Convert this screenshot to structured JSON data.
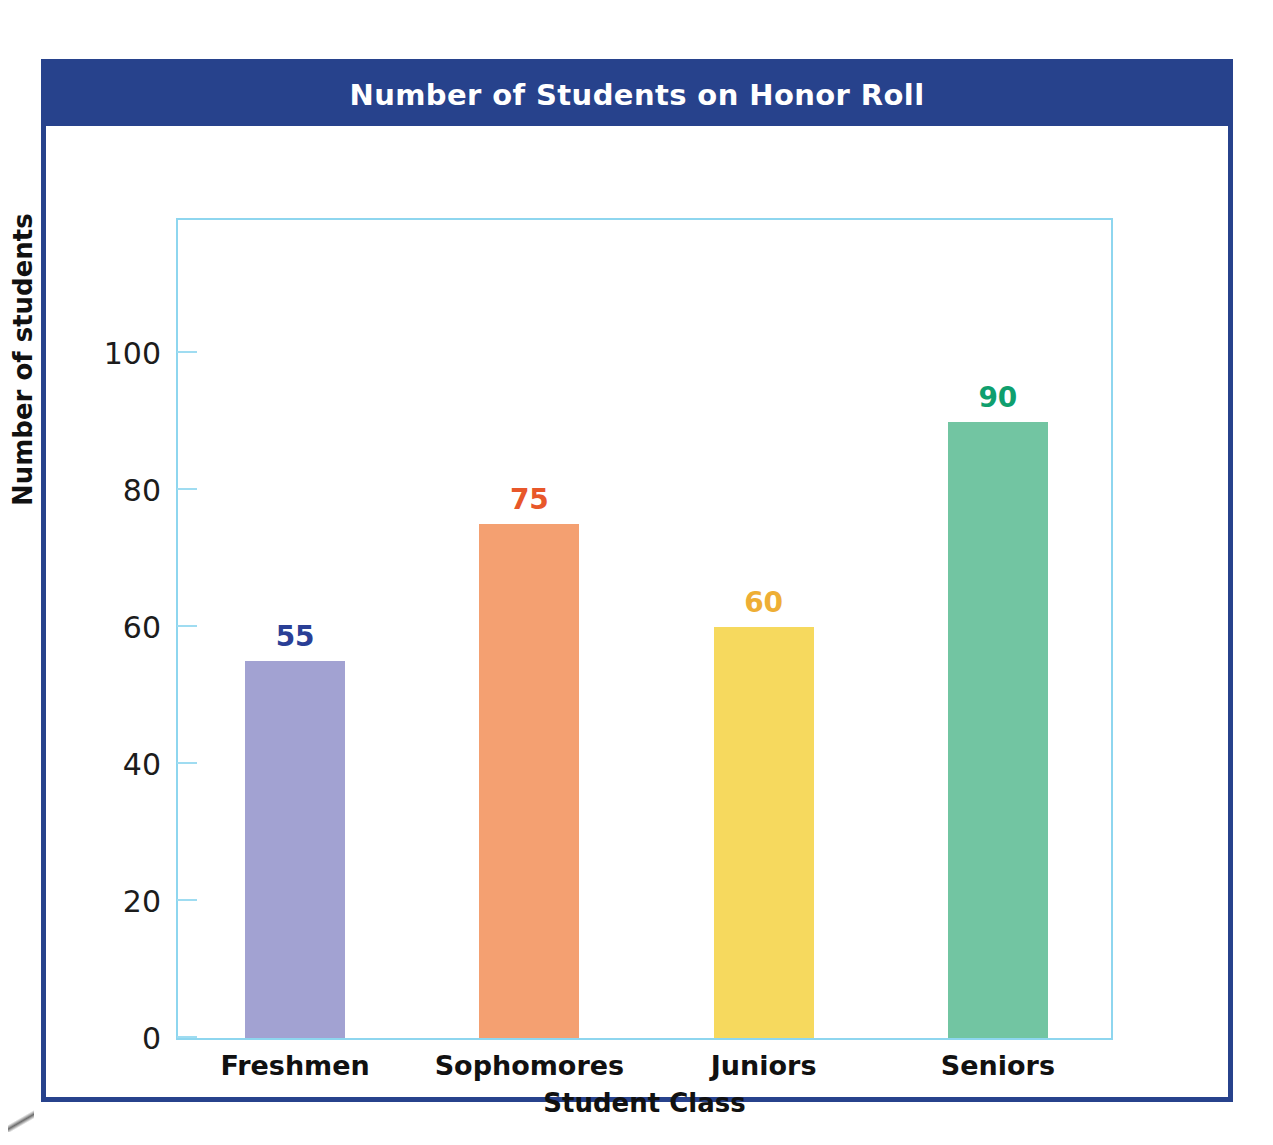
{
  "chart_data": {
    "type": "bar",
    "title": "Number of Students on Honor Roll",
    "xlabel": "Student Class",
    "ylabel": "Number of students",
    "categories": [
      "Freshmen",
      "Sophomores",
      "Juniors",
      "Seniors"
    ],
    "values": [
      55,
      75,
      60,
      90
    ],
    "value_labels": [
      "55",
      "75",
      "60",
      "90"
    ],
    "ylim": [
      0,
      120
    ],
    "yticks": [
      0,
      20,
      40,
      60,
      80,
      100
    ],
    "ytick_labels": [
      "0",
      "20",
      "40",
      "60",
      "80",
      "100"
    ],
    "grid": false,
    "legend": "none",
    "bar_colors": [
      "#a2a2d2",
      "#f4a071",
      "#f6d95e",
      "#72c5a2"
    ],
    "label_colors": [
      "#2a3f96",
      "#e8572a",
      "#eeae35",
      "#0f9f6e"
    ]
  },
  "style": {
    "frame_color": "#27428c",
    "banner_color": "#27428c",
    "banner_text_color": "#ffffff",
    "plot_border_color": "#8ed6ef",
    "tick_color": "#9fdcf1",
    "background": "#ffffff"
  }
}
